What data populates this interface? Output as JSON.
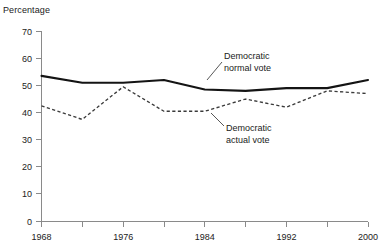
{
  "chart_data": {
    "type": "line",
    "title": "",
    "xlabel": "",
    "ylabel": "Percentage",
    "x": [
      1968,
      1972,
      1976,
      1980,
      1984,
      1988,
      1992,
      1996,
      2000
    ],
    "xlim": [
      1968,
      2000
    ],
    "ylim": [
      0,
      70
    ],
    "grid": false,
    "legend_position": "inline-annotations",
    "x_tick_labels": [
      "1968",
      "",
      "1976",
      "",
      "1984",
      "",
      "1992",
      "",
      "2000"
    ],
    "x_tick_values": [
      1968,
      1972,
      1976,
      1980,
      1984,
      1988,
      1992,
      1996,
      2000
    ],
    "y_tick_labels": [
      "0",
      "10",
      "20",
      "30",
      "40",
      "50",
      "60",
      "70"
    ],
    "y_tick_values": [
      0,
      10,
      20,
      30,
      40,
      50,
      60,
      70
    ],
    "series": [
      {
        "name": "Democratic normal vote",
        "style": "solid",
        "color": "#141414",
        "values": [
          53.5,
          51.0,
          51.0,
          52.0,
          48.5,
          48.0,
          49.0,
          49.0,
          52.0
        ]
      },
      {
        "name": "Democratic actual vote",
        "style": "dashed",
        "color": "#3a3a3a",
        "values": [
          42.5,
          37.5,
          49.5,
          40.5,
          40.5,
          45.0,
          42.0,
          48.0,
          47.0
        ]
      }
    ],
    "annotations": [
      {
        "id": "normal-vote",
        "line1": "Democratic",
        "line2": "normal vote"
      },
      {
        "id": "actual-vote",
        "line1": "Democratic",
        "line2": "actual vote"
      }
    ]
  },
  "axis": {
    "y_label": "Percentage"
  },
  "ticks": {
    "y": [
      {
        "label": "70"
      },
      {
        "label": "60"
      },
      {
        "label": "50"
      },
      {
        "label": "40"
      },
      {
        "label": "30"
      },
      {
        "label": "20"
      },
      {
        "label": "10"
      },
      {
        "label": "0"
      }
    ],
    "x": [
      {
        "label": "1968"
      },
      {
        "label": "1976"
      },
      {
        "label": "1984"
      },
      {
        "label": "1992"
      },
      {
        "label": "2000"
      }
    ]
  },
  "annotations": {
    "normal": {
      "line1": "Democratic",
      "line2": "normal vote"
    },
    "actual": {
      "line1": "Democratic",
      "line2": "actual vote"
    }
  }
}
